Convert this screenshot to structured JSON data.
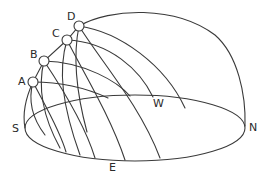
{
  "diagram": {
    "type": "celestial-sphere-sun-paths",
    "stroke_color": "#3a3a3a",
    "background": "#ffffff",
    "sun_positions": [
      {
        "id": "A",
        "label": "A",
        "cx": 33,
        "cy": 82
      },
      {
        "id": "B",
        "label": "B",
        "cx": 44,
        "cy": 61
      },
      {
        "id": "C",
        "label": "C",
        "cx": 67,
        "cy": 40
      },
      {
        "id": "D",
        "label": "D",
        "cx": 79,
        "cy": 26
      }
    ],
    "compass": {
      "south": "S",
      "north": "N",
      "east": "E",
      "west": "W"
    }
  }
}
